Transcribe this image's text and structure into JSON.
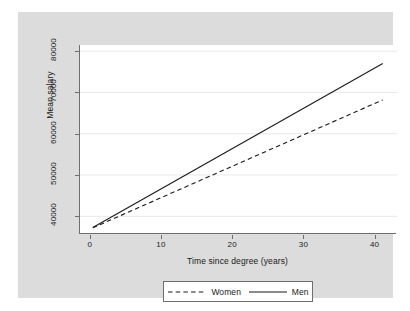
{
  "chart_data": {
    "type": "line",
    "title": "",
    "xlabel": "Time since degree (years)",
    "ylabel": "Mean salary",
    "xlim": [
      -1.5,
      43
    ],
    "ylim": [
      35700,
      81500
    ],
    "xticks": [
      0,
      10,
      20,
      30,
      40
    ],
    "xtick_labels": [
      "0",
      "10",
      "20",
      "30",
      "40"
    ],
    "yticks": [
      40000,
      50000,
      60000,
      70000,
      80000
    ],
    "ytick_labels": [
      "40000",
      "50000",
      "60000",
      "70000",
      "80000"
    ],
    "grid": "horizontal",
    "legend_position": "bottom",
    "series": [
      {
        "name": "Women",
        "style": "dashed",
        "color": "#1a1a1a",
        "x": [
          0.3,
          41
        ],
        "y": [
          37200,
          68200
        ]
      },
      {
        "name": "Men",
        "style": "solid",
        "color": "#1a1a1a",
        "x": [
          0.3,
          41
        ],
        "y": [
          37300,
          77000
        ]
      }
    ]
  },
  "legend": {
    "items": [
      {
        "label": "Women",
        "style": "dashed"
      },
      {
        "label": "Men",
        "style": "solid"
      }
    ]
  },
  "colors": {
    "graph_region": "#dcdcdc",
    "plot_background": "#ffffff",
    "axis": "#6f6f6f",
    "gridline": "#e8e8ec",
    "text": "#1a1a1a"
  }
}
